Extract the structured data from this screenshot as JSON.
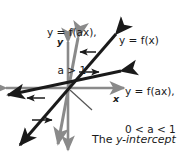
{
  "figure": {
    "type": "math-graph",
    "axes": {
      "x_label": "x",
      "y_label": "y",
      "origin": [
        68,
        88
      ],
      "color": "#8a8a8a"
    },
    "labels": {
      "top_line1": "y = f(ax),",
      "top_line2": "a > 1",
      "right_upper": "y = f(x)",
      "right_lower_line1": "y = f(ax),",
      "right_lower_line2": "0 < a < 1",
      "caption_line1_pre": "The ",
      "caption_line1_em": "y-intercept",
      "caption_line2": "stays the same."
    },
    "curves": [
      {
        "name": "f(ax) a>1",
        "style": "steep-compressed",
        "color": "#8a8a8a"
      },
      {
        "name": "f(x)",
        "style": "medium",
        "color": "#1a1a1a"
      },
      {
        "name": "f(ax) 0<a<1",
        "style": "shallow-stretched",
        "color": "#1a1a1a"
      }
    ],
    "annotations": [
      {
        "name": "compression-arrow",
        "direction": "left"
      },
      {
        "name": "stretch-arrow",
        "direction": "right"
      },
      {
        "name": "compression-arrow-lower",
        "direction": "left"
      },
      {
        "name": "stretch-arrow-lower",
        "direction": "right"
      }
    ]
  }
}
